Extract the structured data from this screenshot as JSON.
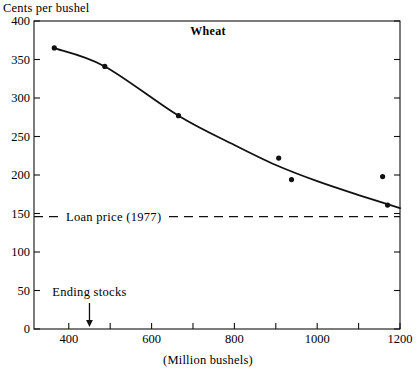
{
  "chart_data": {
    "type": "line",
    "title": "Wheat",
    "ylabel": "Cents per bushel",
    "xlabel": "(Million bushels)",
    "xlim": [
      316,
      1200
    ],
    "ylim": [
      0,
      400
    ],
    "grid": false,
    "legend": "none",
    "x_ticks": [
      400,
      600,
      800,
      1000,
      1200
    ],
    "x_minor_ticks": [
      500,
      700,
      900,
      1100
    ],
    "y_ticks": [
      0,
      50,
      100,
      150,
      200,
      250,
      300,
      350,
      400
    ],
    "series": [
      {
        "name": "Price points",
        "marker": "filled-circle",
        "points": [
          {
            "x": 365,
            "y": 365
          },
          {
            "x": 487,
            "y": 341
          },
          {
            "x": 665,
            "y": 277
          },
          {
            "x": 907,
            "y": 222
          },
          {
            "x": 938,
            "y": 194
          },
          {
            "x": 1158,
            "y": 198
          },
          {
            "x": 1170,
            "y": 161
          }
        ]
      },
      {
        "name": "Fitted demand curve",
        "marker": "none",
        "points": [
          {
            "x": 363,
            "y": 365
          },
          {
            "x": 487,
            "y": 341
          },
          {
            "x": 665,
            "y": 277
          },
          {
            "x": 800,
            "y": 239
          },
          {
            "x": 900,
            "y": 213
          },
          {
            "x": 1000,
            "y": 192
          },
          {
            "x": 1100,
            "y": 174
          },
          {
            "x": 1200,
            "y": 157
          }
        ]
      }
    ],
    "reference_lines": [
      {
        "name": "loan-price",
        "label": "Loan price (1977)",
        "value": 146,
        "style": "dashed",
        "axis": "y"
      }
    ],
    "annotations": [
      {
        "name": "ending-stocks",
        "label": "Ending stocks",
        "x": 450,
        "marker": "down-arrow"
      }
    ]
  }
}
